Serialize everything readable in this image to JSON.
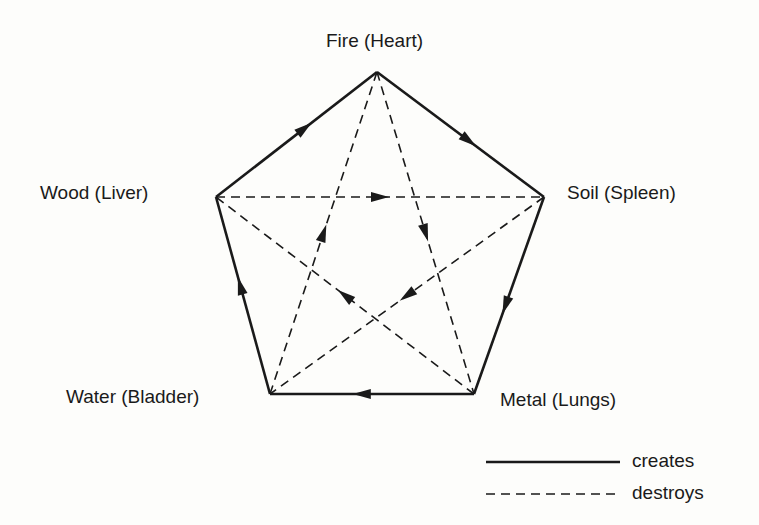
{
  "diagram": {
    "title": "",
    "nodes": [
      {
        "id": "fire",
        "label": "Fire (Heart)",
        "x": 377,
        "y": 72
      },
      {
        "id": "soil",
        "label": "Soil (Spleen)",
        "x": 544,
        "y": 197
      },
      {
        "id": "metal",
        "label": "Metal (Lungs)",
        "x": 474,
        "y": 394
      },
      {
        "id": "water",
        "label": "Water (Bladder)",
        "x": 270,
        "y": 394
      },
      {
        "id": "wood",
        "label": "Wood (Liver)",
        "x": 216,
        "y": 197
      }
    ],
    "creates_edges": [
      {
        "from": "wood",
        "to": "fire"
      },
      {
        "from": "fire",
        "to": "soil"
      },
      {
        "from": "soil",
        "to": "metal"
      },
      {
        "from": "metal",
        "to": "water"
      },
      {
        "from": "water",
        "to": "wood"
      }
    ],
    "destroys_edges": [
      {
        "from": "wood",
        "to": "soil"
      },
      {
        "from": "fire",
        "to": "metal"
      },
      {
        "from": "soil",
        "to": "water"
      },
      {
        "from": "metal",
        "to": "wood"
      },
      {
        "from": "water",
        "to": "fire"
      }
    ],
    "legend": {
      "solid": "creates",
      "dashed": "destroys"
    }
  }
}
